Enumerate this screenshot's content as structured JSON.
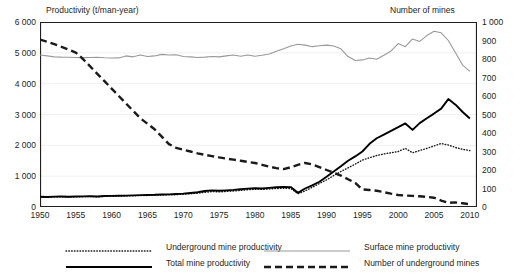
{
  "chart_data": {
    "type": "line",
    "title": "",
    "xlabel": "",
    "ylabel": "Productivity (t/man-year)",
    "y2label": "Number of mines",
    "xlim": [
      1950,
      2011
    ],
    "ylim": [
      0,
      6000
    ],
    "y2lim": [
      0,
      1000
    ],
    "grid": true,
    "legend_position": "bottom",
    "xticks": [
      "1950",
      "1955",
      "1960",
      "1965",
      "1970",
      "1975",
      "1980",
      "1985",
      "1990",
      "1995",
      "2000",
      "2005",
      "2010"
    ],
    "yticks_left": [
      "0",
      "1 000",
      "2 000",
      "3 000",
      "4 000",
      "5 000",
      "6 000"
    ],
    "yticks_right": [
      "0",
      "100",
      "200",
      "300",
      "400",
      "500",
      "600",
      "700",
      "800",
      "900",
      "1 000"
    ],
    "x": [
      1950,
      1951,
      1952,
      1953,
      1954,
      1955,
      1956,
      1957,
      1958,
      1959,
      1960,
      1961,
      1962,
      1963,
      1964,
      1965,
      1966,
      1967,
      1968,
      1969,
      1970,
      1971,
      1972,
      1973,
      1974,
      1975,
      1976,
      1977,
      1978,
      1979,
      1980,
      1981,
      1982,
      1983,
      1984,
      1985,
      1986,
      1987,
      1988,
      1989,
      1990,
      1991,
      1992,
      1993,
      1994,
      1995,
      1996,
      1997,
      1998,
      1999,
      2000,
      2001,
      2002,
      2003,
      2004,
      2005,
      2006,
      2007,
      2008,
      2009,
      2010
    ],
    "series": [
      {
        "name": "Underground mine productivity",
        "axis": "left",
        "style": "dotted",
        "color": "#1a1a1a",
        "values": [
          320,
          315,
          325,
          330,
          320,
          330,
          335,
          340,
          330,
          345,
          350,
          355,
          360,
          365,
          370,
          375,
          380,
          390,
          395,
          400,
          415,
          430,
          450,
          475,
          500,
          490,
          505,
          520,
          540,
          560,
          575,
          570,
          585,
          600,
          605,
          600,
          430,
          520,
          640,
          760,
          880,
          1020,
          1150,
          1270,
          1390,
          1520,
          1600,
          1670,
          1720,
          1760,
          1800,
          1900,
          1760,
          1830,
          1900,
          1980,
          2060,
          2010,
          1930,
          1870,
          1830
        ]
      },
      {
        "name": "Surface mine productivity",
        "axis": "left",
        "style": "solid-thin",
        "color": "#999999",
        "values": [
          4930,
          4900,
          4870,
          4860,
          4855,
          4850,
          4845,
          4850,
          4855,
          4840,
          4830,
          4835,
          4900,
          4870,
          4930,
          4880,
          4900,
          4950,
          4930,
          4940,
          4880,
          4870,
          4850,
          4860,
          4880,
          4870,
          4900,
          4930,
          4890,
          4930,
          4890,
          4920,
          4960,
          5050,
          5130,
          5220,
          5280,
          5250,
          5200,
          5230,
          5250,
          5220,
          5130,
          4880,
          4750,
          4770,
          4830,
          4790,
          4920,
          5060,
          5300,
          5200,
          5450,
          5370,
          5560,
          5700,
          5650,
          5400,
          5000,
          4600,
          4400
        ]
      },
      {
        "name": "Total mine productivity",
        "axis": "left",
        "style": "solid-thick",
        "color": "#000000",
        "values": [
          330,
          325,
          335,
          340,
          330,
          340,
          345,
          350,
          340,
          355,
          360,
          365,
          370,
          378,
          385,
          390,
          395,
          405,
          410,
          420,
          435,
          455,
          480,
          520,
          540,
          525,
          540,
          555,
          575,
          595,
          610,
          600,
          620,
          640,
          650,
          645,
          460,
          600,
          700,
          820,
          980,
          1150,
          1320,
          1500,
          1640,
          1800,
          2050,
          2230,
          2350,
          2470,
          2590,
          2710,
          2500,
          2720,
          2880,
          3030,
          3190,
          3500,
          3320,
          3080,
          2870
        ]
      },
      {
        "name": "Number of underground  mines",
        "axis": "right",
        "style": "dashed",
        "color": "#1a1a1a",
        "values": [
          905,
          893,
          880,
          866,
          851,
          835,
          800,
          760,
          720,
          680,
          640,
          600,
          560,
          520,
          480,
          450,
          420,
          380,
          340,
          320,
          310,
          300,
          290,
          282,
          275,
          268,
          262,
          256,
          250,
          244,
          238,
          228,
          218,
          210,
          205,
          215,
          228,
          238,
          230,
          215,
          200,
          185,
          170,
          150,
          130,
          95,
          92,
          88,
          80,
          72,
          65,
          62,
          60,
          58,
          55,
          50,
          35,
          22,
          25,
          20,
          15
        ]
      }
    ]
  },
  "legend": {
    "items": [
      {
        "label": "Underground mine productivity",
        "style": "dotted"
      },
      {
        "label": "Total mine productivity",
        "style": "solid-thick"
      },
      {
        "label": "Surface mine productivity",
        "style": "solid-thin"
      },
      {
        "label": "Number of underground  mines",
        "style": "dashed"
      }
    ]
  }
}
